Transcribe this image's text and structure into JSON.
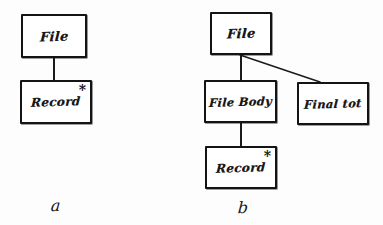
{
  "diagram": {
    "ink_color": "#141414",
    "background_color": "#fdfdfd",
    "figures": [
      {
        "id": "a",
        "caption": "a",
        "nodes": [
          {
            "id": "a-file",
            "label": "File",
            "star": ""
          },
          {
            "id": "a-record",
            "label": "Record",
            "star": "*"
          }
        ],
        "edges": [
          {
            "from": "a-file",
            "to": "a-record",
            "kind": "vertical"
          }
        ]
      },
      {
        "id": "b",
        "caption": "b",
        "nodes": [
          {
            "id": "b-file",
            "label": "File",
            "star": ""
          },
          {
            "id": "b-filebody",
            "label": "File Body",
            "star": ""
          },
          {
            "id": "b-finaltot",
            "label": "Final tot",
            "star": ""
          },
          {
            "id": "b-record",
            "label": "Record",
            "star": "*"
          }
        ],
        "edges": [
          {
            "from": "b-file",
            "to": "b-filebody",
            "kind": "vertical"
          },
          {
            "from": "b-file",
            "to": "b-finaltot",
            "kind": "diagonal"
          },
          {
            "from": "b-filebody",
            "to": "b-record",
            "kind": "vertical"
          }
        ]
      }
    ]
  }
}
